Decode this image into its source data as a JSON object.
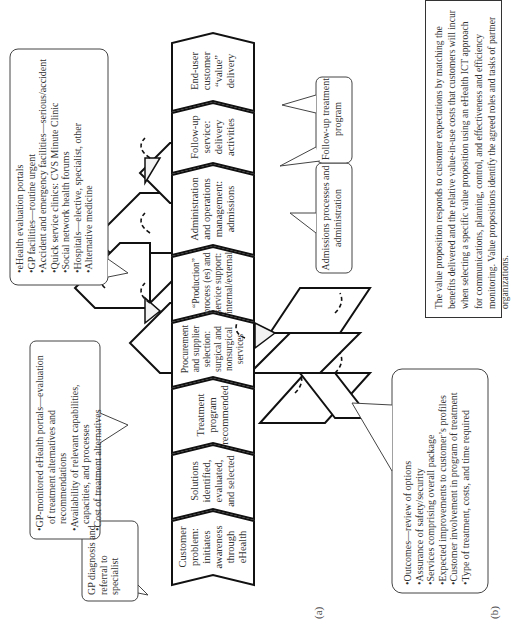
{
  "figure": {
    "orientation": "rotated 90 degrees counter-clockwise",
    "panel_a_label": "(a)",
    "panel_b_label": "(b)"
  },
  "chevrons": [
    {
      "id": "customer-problem",
      "label": "Customer problem: initiates awareness through eHealth"
    },
    {
      "id": "solutions",
      "label": "Solutions identified, evaluated, and selected"
    },
    {
      "id": "treatment-program",
      "label": "Treatment program recommended"
    },
    {
      "id": "procurement",
      "label": "Procurement and supplier selection: surgical and nonsurgical services"
    },
    {
      "id": "production",
      "label": "“Production” process (es) and service support: internal/external"
    },
    {
      "id": "administration",
      "label": "Administration and operations management: admissions"
    },
    {
      "id": "follow-up-service",
      "label": "Follow-up service: delivery activities"
    },
    {
      "id": "end-user",
      "label": "End-user customer “value” delivery"
    }
  ],
  "callouts": {
    "gp_diagnosis": {
      "text": "GP diagnosis and referral to specialist"
    },
    "gp_portals": {
      "items": [
        "GP-monitored eHealth portals—evaluation of treatment alternatives and recommendations",
        "Availability of relevant capabilities, capacities, and processes",
        "Cost of treatment alternatives"
      ]
    },
    "ehealth_portals": {
      "items": [
        "eHealth evaluation portals",
        "GP facilities—routine urgent",
        "Accident and emergency facilities—serious/accident",
        "Quick service clinics: CVS Minute Clinic",
        "Social network health forums",
        "Hospitals—elective, specialist, other",
        "Alternative medicine"
      ]
    },
    "admissions": {
      "text": "Admissions processes and administration"
    },
    "follow_up_program": {
      "text": "Follow-up treatment program"
    },
    "outcomes": {
      "items": [
        "Outcomes—review of options",
        "Assurance of safety/security",
        "Services comprising overall package",
        "Expected improvements to customer’s profiles",
        "Customer involvement in program of treatment",
        "Type of treatment, costs, and time required"
      ]
    }
  },
  "value_proposition": {
    "text": "The value proposition responds to customer expectations by matching the benefits delivered and the relative value-in-use costs that customers will incur when selecting a specific value proposition using an eHealth ICT approach for communications, planning, control, and effectiveness and efficiency monitoring. Value propositions identify the agreed roles and tasks of partner organizations."
  },
  "colors": {
    "stroke": "#111111",
    "text": "#333333",
    "background": "#ffffff",
    "triangle_fill": "#f2f2f2"
  }
}
